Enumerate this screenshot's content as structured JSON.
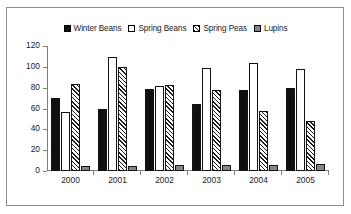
{
  "chart_data": {
    "type": "bar",
    "title": "",
    "xlabel": "",
    "ylabel": "",
    "ylim": [
      0,
      120
    ],
    "yticks": [
      "0",
      "20",
      "40",
      "60",
      "80",
      "100",
      "120"
    ],
    "grid": false,
    "legend_position": "top-center",
    "categories": [
      "2000",
      "2001",
      "2002",
      "2003",
      "2004",
      "2005"
    ],
    "series": [
      {
        "name": "Winter Beans",
        "fill": "solid",
        "color": "#101010",
        "values": [
          70,
          60,
          79,
          64,
          78,
          80
        ]
      },
      {
        "name": "Spring Beans",
        "fill": "white",
        "color": "#ffffff",
        "values": [
          57,
          109,
          82,
          99,
          104,
          98
        ]
      },
      {
        "name": "Spring Peas",
        "fill": "hatch",
        "color": "#ffffff",
        "values": [
          84,
          100,
          83,
          78,
          58,
          48
        ]
      },
      {
        "name": "Lupins",
        "fill": "grey",
        "color": "#868686",
        "values": [
          5,
          5,
          6,
          6,
          6,
          7
        ]
      }
    ]
  }
}
